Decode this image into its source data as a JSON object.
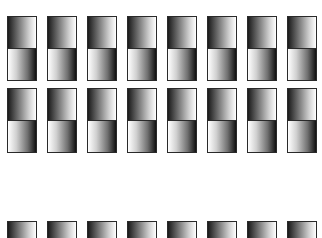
{
  "grid": {
    "columns": 8,
    "column_x": [
      7,
      47,
      87,
      127,
      167,
      207,
      247,
      287
    ],
    "tile_width": 30,
    "rows": [
      {
        "top": 16,
        "height": 65,
        "type": "full"
      },
      {
        "top": 88,
        "height": 65,
        "type": "full"
      },
      {
        "top": 221,
        "height": 17,
        "type": "partial"
      }
    ],
    "colors": {
      "border": "#2a2a2a",
      "dark": "#111111",
      "light": "#ffffff",
      "background": "#ffffff"
    }
  }
}
